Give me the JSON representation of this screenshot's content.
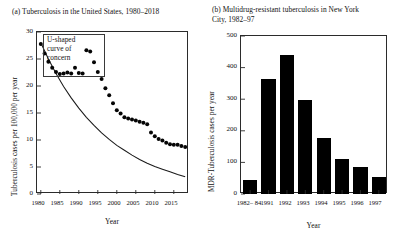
{
  "figure": {
    "panel_a": {
      "title": "(a) Tuberculosis in the United States, 1980–2018",
      "annotation": "U-shaped\ncurve of\nconcern"
    },
    "panel_b": {
      "title": "(b) Multidrug-resistant tuberculosis in New York\n      City, 1982–97"
    }
  },
  "chart_data": [
    {
      "type": "scatter",
      "panel": "a",
      "title": "(a) Tuberculosis in the United States, 1980–2018",
      "xlabel": "Year",
      "ylabel": "Tuberculosis cases per 100,000 per year",
      "xlim": [
        1979,
        2019
      ],
      "ylim": [
        0,
        30
      ],
      "xticks": [
        1980,
        1985,
        1990,
        1995,
        2000,
        2005,
        2010,
        2015
      ],
      "xtick_labels": [
        "1980",
        "1985",
        "1990",
        "1995",
        "2000",
        "2005",
        "2010",
        "2015"
      ],
      "yticks": [
        0,
        5,
        10,
        15,
        20,
        25,
        30
      ],
      "ytick_labels": [
        "0",
        "5",
        "10",
        "15",
        "20",
        "25",
        "30"
      ],
      "grid": false,
      "legend": "none",
      "annotations": [
        {
          "text": "U-shaped\ncurve of\nconcern",
          "x": 1981.5,
          "y": 27.5
        }
      ],
      "series": [
        {
          "name": "Reported TB cases per 100,000",
          "marker": "filled-circle",
          "x": [
            1980,
            1981,
            1982,
            1983,
            1984,
            1985,
            1986,
            1987,
            1988,
            1989,
            1990,
            1991,
            1992,
            1993,
            1994,
            1995,
            1996,
            1997,
            1998,
            1999,
            2000,
            2001,
            2002,
            2003,
            2004,
            2005,
            2006,
            2007,
            2008,
            2009,
            2010,
            2011,
            2012,
            2013,
            2014,
            2015,
            2016,
            2017,
            2018
          ],
          "values": [
            27.8,
            26.0,
            24.5,
            23.4,
            22.6,
            22.2,
            22.3,
            22.5,
            22.3,
            23.4,
            22.4,
            22.3,
            26.6,
            26.4,
            24.4,
            22.6,
            21.3,
            19.6,
            18.3,
            16.8,
            15.5,
            14.9,
            14.2,
            14.0,
            13.8,
            13.6,
            13.4,
            13.2,
            12.9,
            11.4,
            10.7,
            10.2,
            9.9,
            9.5,
            9.2,
            9.1,
            9.1,
            8.9,
            8.7
          ]
        },
        {
          "name": "Expected decline curve",
          "marker": "line",
          "x": [
            1980,
            1982,
            1984,
            1986,
            1988,
            1990,
            1992,
            1994,
            1996,
            1998,
            2000,
            2002,
            2004,
            2006,
            2008,
            2010,
            2012,
            2014,
            2016,
            2018
          ],
          "values": [
            28.0,
            25.0,
            22.3,
            19.9,
            17.8,
            15.9,
            14.2,
            12.7,
            11.3,
            10.1,
            9.0,
            8.1,
            7.2,
            6.4,
            5.7,
            5.1,
            4.6,
            4.1,
            3.6,
            3.2
          ]
        }
      ]
    },
    {
      "type": "bar",
      "panel": "b",
      "title": "(b) Multidrug-resistant tuberculosis in New York City, 1982–97",
      "xlabel": "Year",
      "ylabel": "MDR-Tuberculosis cases per year",
      "categories": [
        "1982–\n84",
        "1991",
        "1992",
        "1993",
        "1994",
        "1995",
        "1996",
        "1997"
      ],
      "category_labels": [
        "1982–84",
        "1991",
        "1992",
        "1993",
        "1994",
        "1995",
        "1996",
        "1997"
      ],
      "values": [
        45,
        365,
        440,
        297,
        177,
        110,
        87,
        55
      ],
      "ylim": [
        0,
        500
      ],
      "yticks": [
        0,
        100,
        200,
        300,
        400,
        500
      ],
      "ytick_labels": [
        "0",
        "100",
        "200",
        "300",
        "400",
        "500"
      ],
      "bar_color": "#000000",
      "grid": false,
      "legend": "none"
    }
  ],
  "axes": {
    "panel_a": {
      "xlabel": "Year",
      "ylabel": "Tuberculosis cases per 100,000 per year",
      "ytick_labels": [
        "30",
        "25",
        "20",
        "15",
        "10",
        "5",
        "0"
      ],
      "xtick_labels": [
        "1980",
        "1985",
        "1990",
        "1995",
        "2000",
        "2005",
        "2010",
        "2015"
      ]
    },
    "panel_b": {
      "xlabel": "Year",
      "ylabel": "MDR-Tuberculosis cases per year",
      "ytick_labels": [
        "500",
        "400",
        "300",
        "200",
        "100",
        "0"
      ],
      "xtick_labels": [
        "1982–\n84",
        "1991",
        "1992",
        "1993",
        "1994",
        "1995",
        "1996",
        "1997"
      ]
    }
  }
}
